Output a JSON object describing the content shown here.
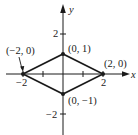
{
  "figure": {
    "type": "coordinate-plane-diamond",
    "axes": {
      "x_label": "x",
      "y_label": "y",
      "x_ticks": [
        {
          "value": -2,
          "label": "−2"
        },
        {
          "value": -1,
          "label": ""
        },
        {
          "value": 1,
          "label": ""
        },
        {
          "value": 2,
          "label": "2"
        }
      ],
      "y_ticks": [
        {
          "value": 2,
          "label": "2"
        },
        {
          "value": -2,
          "label": "−2"
        }
      ]
    },
    "vertices": [
      {
        "x": -2,
        "y": 0,
        "label": "(−2, 0)"
      },
      {
        "x": 0,
        "y": 1,
        "label": "(0, 1)"
      },
      {
        "x": 2,
        "y": 0,
        "label": "(2, 0)"
      },
      {
        "x": 0,
        "y": -1,
        "label": "(0, −1)"
      }
    ],
    "colors": {
      "line": "#1a1a1a",
      "background": "#ffffff"
    }
  }
}
